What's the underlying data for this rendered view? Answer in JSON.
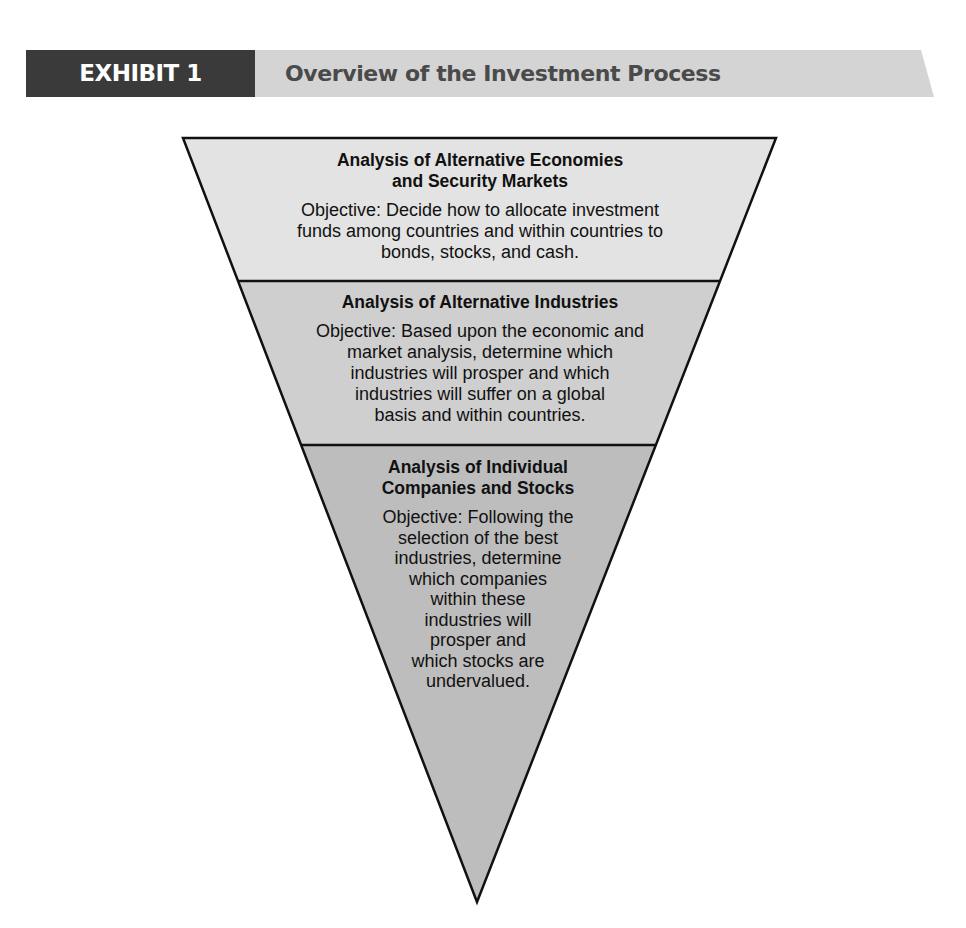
{
  "header": {
    "exhibit_label": "EXHIBIT 1",
    "title": "Overview of the Investment Process",
    "colors": {
      "label_bg": "#3a3a3a",
      "bar_bg": "#d4d4d4",
      "title_text": "#4a4a4a"
    }
  },
  "funnel": {
    "colors": {
      "tier1": "#e3e3e3",
      "tier2": "#cfcfcf",
      "tier3": "#bdbdbd",
      "stroke": "#111111"
    },
    "tiers": [
      {
        "heading_line1": "Analysis of Alternative Economies",
        "heading_line2": "and Security Markets",
        "objective_lines": [
          "Objective: Decide how to allocate investment",
          "funds among countries and within countries to",
          "bonds, stocks, and cash."
        ]
      },
      {
        "heading_line1": "Analysis of Alternative Industries",
        "objective_lines": [
          "Objective: Based upon the economic and",
          "market analysis, determine which",
          "industries will prosper and which",
          "industries will suffer on a global",
          "basis and within countries."
        ]
      },
      {
        "heading_line1": "Analysis of Individual",
        "heading_line2": "Companies and Stocks",
        "objective_lines": [
          "Objective: Following the",
          "selection of the best",
          "industries, determine",
          "which companies",
          "within these",
          "industries will",
          "prosper and",
          "which stocks are",
          "undervalued."
        ]
      }
    ]
  }
}
